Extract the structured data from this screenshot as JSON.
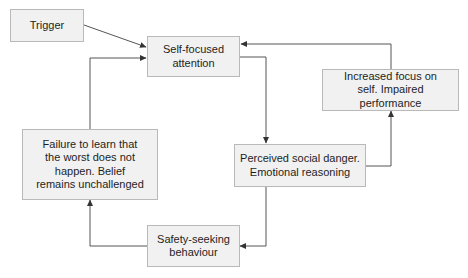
{
  "diagram": {
    "colors": {
      "box_fill": "#f1f1f1",
      "box_border": "#b9b9b9",
      "line": "#444444",
      "text": "#1e1e1e",
      "background": "#ffffff"
    },
    "nodes": [
      {
        "id": "trigger",
        "label": "Trigger"
      },
      {
        "id": "self-focused-attention",
        "label": "Self-focused attention"
      },
      {
        "id": "increased-focus",
        "label": "Increased focus on self. Impaired performance"
      },
      {
        "id": "failure-to-learn",
        "label": "Failure to learn that the worst does not happen. Belief remains unchallenged"
      },
      {
        "id": "perceived-social-danger",
        "label": "Perceived social danger. Emotional reasoning"
      },
      {
        "id": "safety-seeking",
        "label": "Safety-seeking behaviour"
      }
    ],
    "edges": [
      {
        "from": "trigger",
        "to": "self-focused-attention"
      },
      {
        "from": "self-focused-attention",
        "to": "perceived-social-danger"
      },
      {
        "from": "perceived-social-danger",
        "to": "increased-focus"
      },
      {
        "from": "increased-focus",
        "to": "self-focused-attention"
      },
      {
        "from": "perceived-social-danger",
        "to": "safety-seeking"
      },
      {
        "from": "safety-seeking",
        "to": "failure-to-learn"
      },
      {
        "from": "failure-to-learn",
        "to": "self-focused-attention"
      }
    ],
    "lines": {
      "trigger": [
        "Trigger"
      ],
      "self_focused": [
        "Self-focused",
        "attention"
      ],
      "increased_focus": [
        "Increased focus on",
        "self. Impaired performance"
      ],
      "failure": [
        "Failure to learn that",
        "the worst does not",
        "happen. Belief",
        "remains unchallenged"
      ],
      "perceived": [
        "Perceived social danger.",
        "Emotional reasoning"
      ],
      "safety": [
        "Safety-seeking",
        "behaviour"
      ]
    }
  }
}
